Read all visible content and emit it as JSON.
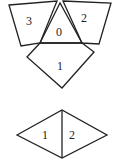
{
  "diagram": {
    "top_figure": {
      "triangle": {
        "label": "0",
        "points": "60,3 40,43 82,43",
        "label_pos": [
          58,
          35
        ]
      },
      "left_quad": {
        "label": "3",
        "points": "9,5 57,1 40,43 21,46",
        "label_pos": [
          29,
          21
        ]
      },
      "right_quad": {
        "label": "2",
        "points": "63,1 111,3 99,44 82,43",
        "label_pos": [
          82,
          21
        ]
      },
      "bottom_quad": {
        "label": "1",
        "points": "40,43 82,43 94,52 62,88 27,57",
        "label_pos": [
          58,
          70
        ]
      }
    },
    "bottom_figure": {
      "diamond": {
        "points": "17,135 62,110 107,135 62,158"
      },
      "divider": {
        "x": 62,
        "y1": 110,
        "y2": 158
      },
      "left_label": {
        "label": "1",
        "pos": [
          44,
          139
        ]
      },
      "right_label": {
        "label": "2",
        "pos": [
          71,
          139
        ]
      }
    }
  }
}
